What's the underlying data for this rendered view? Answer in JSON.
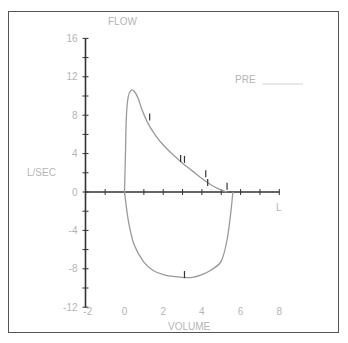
{
  "chart_data": {
    "type": "line",
    "title": "",
    "xlabel": "VOLUME",
    "ylabel": "FLOW",
    "ylabel_units": "L/SEC",
    "xlabel_units": "L",
    "annotation": "PRE",
    "xlim": [
      -2,
      8
    ],
    "ylim": [
      -12,
      16
    ],
    "x_ticks": [
      "-2",
      "0",
      "2",
      "4",
      "6",
      "8"
    ],
    "y_ticks": [
      "16",
      "12",
      "8",
      "4",
      "0",
      "-4",
      "-8",
      "-12"
    ],
    "grid": false,
    "series": [
      {
        "name": "Expiratory limb",
        "x": [
          0.0,
          0.05,
          0.1,
          0.2,
          0.35,
          0.5,
          0.7,
          0.9,
          1.2,
          1.6,
          2.0,
          2.5,
          3.0,
          3.5,
          4.0,
          4.5,
          5.0,
          5.3
        ],
        "y": [
          0.0,
          4.0,
          8.0,
          10.0,
          10.6,
          10.5,
          9.8,
          8.6,
          7.2,
          5.9,
          4.9,
          3.9,
          3.0,
          2.2,
          1.4,
          0.7,
          0.2,
          0.0
        ]
      },
      {
        "name": "Inspiratory limb",
        "x": [
          0.0,
          0.2,
          0.5,
          1.0,
          1.5,
          2.0,
          2.5,
          3.0,
          3.5,
          4.0,
          4.5,
          5.0,
          5.3,
          5.5,
          5.6
        ],
        "y": [
          0.0,
          -3.0,
          -5.5,
          -7.3,
          -8.2,
          -8.6,
          -8.8,
          -8.9,
          -8.9,
          -8.6,
          -8.1,
          -7.2,
          -5.0,
          -2.0,
          0.0
        ]
      }
    ],
    "markers": [
      {
        "x": 1.3,
        "y": 7.8
      },
      {
        "x": 2.9,
        "y": 3.5
      },
      {
        "x": 3.1,
        "y": 3.4
      },
      {
        "x": 4.2,
        "y": 1.9
      },
      {
        "x": 4.3,
        "y": 1.0
      },
      {
        "x": 5.3,
        "y": 0.6
      },
      {
        "x": 3.1,
        "y": -8.6
      }
    ]
  },
  "labels": {
    "flow": "FLOW",
    "lsec": "L/SEC",
    "volume": "VOLUME",
    "l": "L",
    "pre": "PRE"
  }
}
